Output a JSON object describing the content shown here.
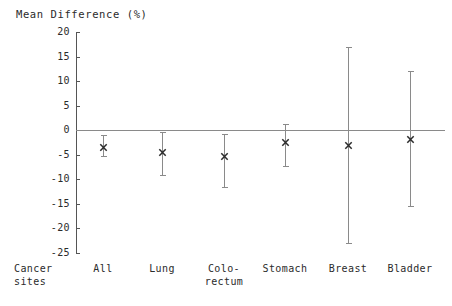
{
  "chart_data": {
    "type": "scatter",
    "title": "",
    "ylabel": "Mean Difference (%)",
    "xlabel": "Cancer\nsites",
    "ylim": [
      -25,
      20
    ],
    "yticks": [
      20,
      15,
      10,
      5,
      0,
      -5,
      -10,
      -15,
      -20,
      -25
    ],
    "ytick_labels": [
      "20",
      "15",
      "10",
      "5",
      "0",
      "-5",
      "-10",
      "-15",
      "-20",
      "-25"
    ],
    "grid": false,
    "legend": "none",
    "zero_line": 0,
    "marker": "x",
    "categories": [
      "All",
      "Lung",
      "Colo-\nrectum",
      "Stomach",
      "Breast",
      "Bladder"
    ],
    "category_labels": [
      "All",
      "Lung",
      "Colo-rectum",
      "Stomach",
      "Breast",
      "Bladder"
    ],
    "values": [
      -3.5,
      -4.4,
      -5.3,
      -2.3,
      -3.0,
      -1.7
    ],
    "ci_upper": [
      -1.0,
      -0.3,
      -0.7,
      1.3,
      17.0,
      12.0
    ],
    "ci_lower": [
      -5.3,
      -9.2,
      -11.5,
      -7.3,
      -23.0,
      -15.5
    ],
    "points": [
      {
        "category": "All",
        "mean": -3.5,
        "upper": -1.0,
        "lower": -5.3
      },
      {
        "category": "Lung",
        "mean": -4.4,
        "upper": -0.3,
        "lower": -9.2
      },
      {
        "category": "Colo-rectum",
        "mean": -5.3,
        "upper": -0.7,
        "lower": -11.5
      },
      {
        "category": "Stomach",
        "mean": -2.3,
        "upper": 1.3,
        "lower": -7.3
      },
      {
        "category": "Breast",
        "mean": -3.0,
        "upper": 17.0,
        "lower": -23.0
      },
      {
        "category": "Bladder",
        "mean": -1.7,
        "upper": 12.0,
        "lower": -15.5
      }
    ]
  },
  "colors": {
    "ink": "#2b2b2b",
    "axis": "#555555",
    "error_bar": "#8a8a8a",
    "zero_line": "#8a8a8a",
    "background": "#ffffff"
  }
}
